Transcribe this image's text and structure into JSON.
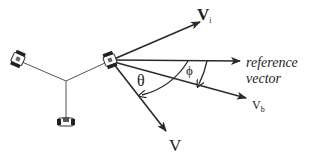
{
  "diagram": {
    "type": "vector-angle-diagram",
    "colors": {
      "stroke": "#2a2a2a",
      "thin_stroke": "#555555",
      "text": "#222222",
      "background": "#ffffff"
    },
    "nodes": [
      {
        "id": "robot-main",
        "kind": "robot",
        "x": 110,
        "y": 60
      },
      {
        "id": "robot-left",
        "kind": "robot",
        "x": 18,
        "y": 60
      },
      {
        "id": "robot-bottom",
        "kind": "robot",
        "x": 66,
        "y": 121
      },
      {
        "id": "junction",
        "kind": "point",
        "x": 66,
        "y": 81
      }
    ],
    "edges": [
      {
        "from": "robot-left",
        "to": "junction"
      },
      {
        "from": "robot-main",
        "to": "junction"
      },
      {
        "from": "robot-bottom",
        "to": "junction"
      }
    ],
    "vectors": [
      {
        "id": "vi",
        "label": "V",
        "subscript": "i",
        "from": [
          110,
          60
        ],
        "to": [
          200,
          22
        ]
      },
      {
        "id": "reference",
        "label": "reference vector",
        "from": [
          110,
          60
        ],
        "to": [
          240,
          61
        ]
      },
      {
        "id": "vb",
        "label": "V",
        "subscript": "b",
        "from": [
          110,
          60
        ],
        "to": [
          246,
          98
        ]
      },
      {
        "id": "v",
        "label": "V",
        "from": [
          110,
          60
        ],
        "to": [
          166,
          131
        ]
      }
    ],
    "angles": [
      {
        "id": "theta",
        "symbol": "θ",
        "between": [
          "reference",
          "v"
        ]
      },
      {
        "id": "phi",
        "symbol": "ϕ",
        "between": [
          "reference",
          "vb"
        ]
      }
    ]
  },
  "labels": {
    "vi_main": "V",
    "vi_sub": "i",
    "reference_line1": "reference",
    "reference_line2": "vector",
    "vb_main": "V",
    "vb_sub": "b",
    "v": "V",
    "theta": "θ",
    "phi": "ϕ"
  }
}
